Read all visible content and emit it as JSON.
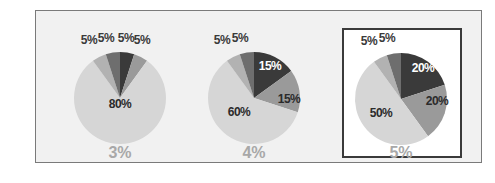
{
  "chart_data": [
    {
      "type": "pie",
      "title": "3%",
      "slices": [
        {
          "label": "5%",
          "value": 5,
          "color": "#3a3a3a"
        },
        {
          "label": "5%",
          "value": 5,
          "color": "#9a9a9a"
        },
        {
          "label": "80%",
          "value": 80,
          "color": "#d6d6d6"
        },
        {
          "label": "5%",
          "value": 5,
          "color": "#b2b2b2"
        },
        {
          "label": "5%",
          "value": 5,
          "color": "#6e6e6e"
        }
      ],
      "highlighted": false
    },
    {
      "type": "pie",
      "title": "4%",
      "slices": [
        {
          "label": "15%",
          "value": 15,
          "color": "#3a3a3a"
        },
        {
          "label": "15%",
          "value": 15,
          "color": "#9a9a9a"
        },
        {
          "label": "60%",
          "value": 60,
          "color": "#d6d6d6"
        },
        {
          "label": "5%",
          "value": 5,
          "color": "#b2b2b2"
        },
        {
          "label": "5%",
          "value": 5,
          "color": "#6e6e6e"
        }
      ],
      "highlighted": false
    },
    {
      "type": "pie",
      "title": "5%",
      "slices": [
        {
          "label": "20%",
          "value": 20,
          "color": "#3a3a3a"
        },
        {
          "label": "20%",
          "value": 20,
          "color": "#9a9a9a"
        },
        {
          "label": "50%",
          "value": 50,
          "color": "#d6d6d6"
        },
        {
          "label": "5%",
          "value": 5,
          "color": "#b2b2b2"
        },
        {
          "label": "5%",
          "value": 5,
          "color": "#6e6e6e"
        }
      ],
      "highlighted": true
    }
  ],
  "captions": [
    "3%",
    "4%",
    "5%"
  ]
}
